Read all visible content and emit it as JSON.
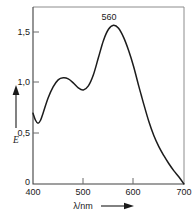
{
  "chart_data": {
    "type": "line",
    "title": "",
    "xlabel": "λ/nm",
    "ylabel": "E",
    "xlim": [
      400,
      700
    ],
    "ylim": [
      0,
      1.75
    ],
    "grid": false,
    "legend": null,
    "x_ticks": [
      "400",
      "500",
      "600",
      "700"
    ],
    "x_tick_values": [
      400,
      500,
      600,
      700
    ],
    "y_ticks": [
      "0",
      "0,5",
      "1,0",
      "1,5"
    ],
    "y_tick_values": [
      0,
      0.5,
      1.0,
      1.5
    ],
    "annotations": [
      {
        "text": "560",
        "x": 560,
        "y": 1.57
      }
    ],
    "series": [
      {
        "name": "absorption",
        "color": "#1c1c1c",
        "x": [
          400,
          405,
          410,
          415,
          420,
          430,
          440,
          450,
          460,
          470,
          480,
          490,
          500,
          510,
          520,
          530,
          540,
          550,
          560,
          570,
          580,
          590,
          600,
          610,
          615,
          620,
          630,
          640,
          650,
          660,
          670,
          680,
          690,
          700
        ],
        "y": [
          0.7,
          0.63,
          0.6,
          0.63,
          0.7,
          0.85,
          0.96,
          1.03,
          1.05,
          1.04,
          1.0,
          0.95,
          0.93,
          0.97,
          1.08,
          1.25,
          1.42,
          1.53,
          1.57,
          1.54,
          1.45,
          1.32,
          1.16,
          0.97,
          0.88,
          0.79,
          0.62,
          0.48,
          0.37,
          0.28,
          0.2,
          0.13,
          0.07,
          0.0
        ]
      }
    ]
  },
  "axis_arrows": {
    "y_arrow": "up-arrow-icon",
    "x_arrow": "right-arrow-icon"
  },
  "colors": {
    "curve": "#1c1c1c",
    "frame": "#8c8c8c",
    "axis": "#404040",
    "text": "#1a1a1a",
    "background": "#ffffff"
  }
}
